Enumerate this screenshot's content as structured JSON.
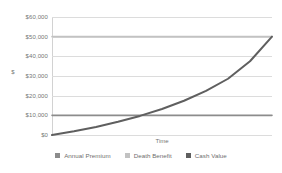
{
  "chart_data": {
    "type": "line",
    "title": "",
    "xlabel": "Time",
    "ylabel": "$",
    "ylim": [
      0,
      60000
    ],
    "grid": true,
    "legend_position": "bottom",
    "ytick_labels": [
      "$60,000",
      "$50,000",
      "$40,000",
      "$30,000",
      "$20,000",
      "$10,000",
      "$0"
    ],
    "ytick_values": [
      60000,
      50000,
      40000,
      30000,
      20000,
      10000,
      0
    ],
    "xtick_labels": [],
    "x": [
      0,
      10,
      20,
      30,
      40,
      50,
      60,
      70,
      80,
      90,
      100
    ],
    "series": [
      {
        "name": "Annual Premium",
        "color": "#8c8c8c",
        "width": 1.6,
        "values": [
          10000,
          10000,
          10000,
          10000,
          10000,
          10000,
          10000,
          10000,
          10000,
          10000,
          10000
        ]
      },
      {
        "name": "Death Benefit",
        "color": "#c2c2c2",
        "width": 1.6,
        "values": [
          50000,
          50000,
          50000,
          50000,
          50000,
          50000,
          50000,
          50000,
          50000,
          50000,
          50000
        ]
      },
      {
        "name": "Cash Value",
        "color": "#5f5f5f",
        "width": 2.0,
        "values": [
          0,
          1900,
          4100,
          6700,
          9700,
          13200,
          17400,
          22400,
          28600,
          37500,
          50000
        ]
      }
    ]
  },
  "legend": {
    "items": [
      {
        "label": "Annual Premium",
        "color": "#8c8c8c"
      },
      {
        "label": "Death Benefit",
        "color": "#c2c2c2"
      },
      {
        "label": "Cash Value",
        "color": "#5f5f5f"
      }
    ]
  },
  "colors": {
    "background": "#ffffff",
    "gridline": "#dcdcdc",
    "axis": "#d2d2d2",
    "text": "#757575"
  }
}
